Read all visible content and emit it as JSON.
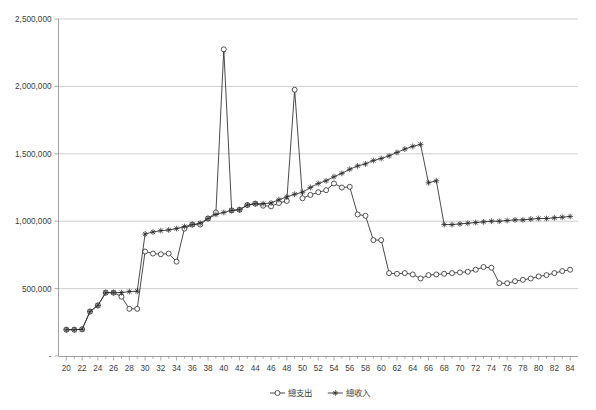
{
  "chart_data": {
    "type": "line",
    "title": "",
    "subtitle": "",
    "xlabel": "",
    "ylabel": "",
    "xlim": [
      19,
      85
    ],
    "ylim": [
      0,
      2500000
    ],
    "grid": true,
    "legend_position": "bottom-center",
    "y_ticks": [
      0,
      500000,
      1000000,
      1500000,
      2000000,
      2500000
    ],
    "y_tick_labels": [
      "-",
      "500,000",
      "1,000,000",
      "1,500,000",
      "2,000,000",
      "2,500,000"
    ],
    "x_ticks_major": [
      20,
      22,
      24,
      26,
      28,
      30,
      32,
      34,
      36,
      38,
      40,
      42,
      44,
      46,
      48,
      50,
      52,
      54,
      56,
      58,
      60,
      62,
      64,
      66,
      68,
      70,
      72,
      74,
      76,
      78,
      80,
      82,
      84
    ],
    "x_tick_labels": [
      "20",
      "22",
      "24",
      "26",
      "28",
      "30",
      "32",
      "34",
      "36",
      "38",
      "40",
      "42",
      "44",
      "46",
      "48",
      "50",
      "52",
      "54",
      "56",
      "58",
      "60",
      "62",
      "64",
      "66",
      "68",
      "70",
      "72",
      "74",
      "76",
      "78",
      "80",
      "82",
      "84"
    ],
    "x": [
      20,
      21,
      22,
      23,
      24,
      25,
      26,
      27,
      28,
      29,
      30,
      31,
      32,
      33,
      34,
      35,
      36,
      37,
      38,
      39,
      40,
      41,
      42,
      43,
      44,
      45,
      46,
      47,
      48,
      49,
      50,
      51,
      52,
      53,
      54,
      55,
      56,
      57,
      58,
      59,
      60,
      61,
      62,
      63,
      64,
      65,
      66,
      67,
      68,
      69,
      70,
      71,
      72,
      73,
      74,
      75,
      76,
      77,
      78,
      79,
      80,
      81,
      82,
      83,
      84
    ],
    "series": [
      {
        "name": "總支出",
        "marker": "circle",
        "values": [
          195000,
          195000,
          198000,
          330000,
          375000,
          470000,
          470000,
          440000,
          350000,
          350000,
          775000,
          760000,
          755000,
          760000,
          700000,
          945000,
          975000,
          975000,
          1020000,
          1065000,
          2275000,
          1080000,
          1085000,
          1120000,
          1130000,
          1115000,
          1110000,
          1135000,
          1150000,
          1975000,
          1170000,
          1195000,
          1215000,
          1230000,
          1280000,
          1250000,
          1255000,
          1050000,
          1040000,
          860000,
          860000,
          615000,
          610000,
          615000,
          605000,
          575000,
          600000,
          605000,
          610000,
          615000,
          620000,
          625000,
          640000,
          660000,
          655000,
          540000,
          540000,
          555000,
          565000,
          575000,
          590000,
          600000,
          615000,
          630000,
          640000
        ]
      },
      {
        "name": "總收入",
        "marker": "star",
        "values": [
          195000,
          195000,
          198000,
          330000,
          375000,
          470000,
          470000,
          470000,
          478000,
          480000,
          905000,
          920000,
          930000,
          935000,
          945000,
          960000,
          975000,
          985000,
          1020000,
          1050000,
          1065000,
          1080000,
          1085000,
          1120000,
          1130000,
          1130000,
          1135000,
          1160000,
          1180000,
          1200000,
          1215000,
          1250000,
          1280000,
          1300000,
          1330000,
          1355000,
          1385000,
          1410000,
          1425000,
          1450000,
          1465000,
          1485000,
          1510000,
          1535000,
          1555000,
          1570000,
          1285000,
          1300000,
          975000,
          975000,
          980000,
          985000,
          990000,
          995000,
          1000000,
          1000000,
          1005000,
          1010000,
          1010000,
          1015000,
          1020000,
          1020000,
          1025000,
          1030000,
          1035000
        ]
      }
    ],
    "legend": [
      {
        "label": "總支出",
        "marker": "circle"
      },
      {
        "label": "總收入",
        "marker": "star"
      }
    ],
    "colors": {
      "series_line": "#2a2a2a",
      "gridline": "#b8b8b8",
      "axis": "#8c8c8c",
      "text": "#3c3c3c",
      "background": "#ffffff"
    }
  }
}
